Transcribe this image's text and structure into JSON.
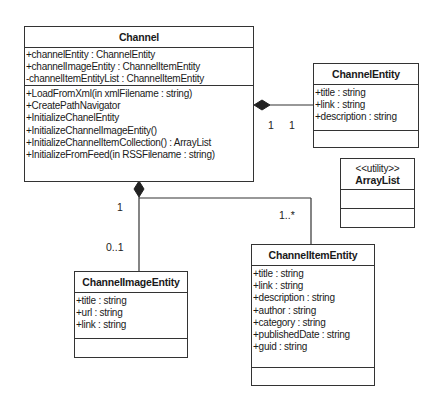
{
  "classes": {
    "channel": {
      "name": "Channel",
      "attributes": [
        "+channelEntity : ChannelEntity",
        "+channelImageEntity : ChannelItemEntity",
        "-channelItemEntityList : ChannelItemEntity"
      ],
      "operations": [
        "+LoadFromXml(in xmlFilename :  string)",
        "+CreatePathNavigator",
        "+InitializeChanelEntity",
        "+InitializeChannelImageEntity()",
        "+InitializeChannelItemCollection() : ArrayList",
        "+InitializeFromFeed(in RSSFilename : string)"
      ]
    },
    "channel_entity": {
      "name": "ChannelEntity",
      "attributes": [
        "+title : string",
        "+link : string",
        "+description : string"
      ]
    },
    "array_list": {
      "stereotype": "<<utility>>",
      "name": "ArrayList"
    },
    "channel_image_entity": {
      "name": "ChannelImageEntity",
      "attributes": [
        "+title : string",
        "+url : string",
        "+link : string"
      ]
    },
    "channel_item_entity": {
      "name": "ChannelItemEntity",
      "attributes": [
        "+title : string",
        "+link : string",
        "+description : string",
        "+author : string",
        "+category : string",
        "+publishedDate : string",
        "+guid : string"
      ]
    }
  },
  "associations": {
    "channel_to_entity": {
      "source_mult": "1",
      "target_mult": "1",
      "kind": "composition"
    },
    "channel_to_image": {
      "source_mult": "1",
      "target_mult": "0..1",
      "kind": "composition"
    },
    "channel_to_item": {
      "target_mult": "1..*",
      "kind": "composition"
    }
  }
}
